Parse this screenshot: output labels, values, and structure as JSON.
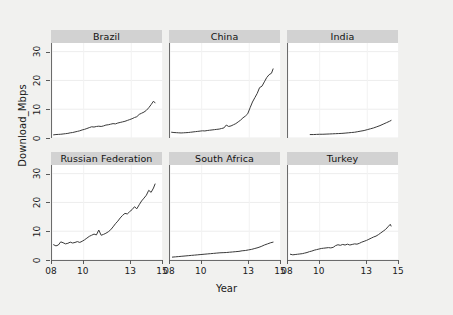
{
  "chart_data": {
    "type": "line",
    "title": "",
    "xlabel": "Year",
    "ylabel": "Download_Mbps",
    "xlim": [
      2008,
      2015
    ],
    "ylim": [
      0,
      33
    ],
    "xticks": [
      2008,
      2010,
      2013,
      2015
    ],
    "xtick_labels": [
      "08",
      "10",
      "13",
      "15"
    ],
    "yticks": [
      0,
      10,
      20,
      30
    ],
    "ytick_labels": [
      "0",
      "10",
      "20",
      "30"
    ],
    "grid": true,
    "legend": "none",
    "layout": {
      "rows": 2,
      "cols": 3
    },
    "line_color": "#3a3a3a",
    "panels": [
      {
        "label": "Brazil",
        "row": 0,
        "col": 0,
        "x": [
          2008.1,
          2008.25,
          2008.4,
          2008.55,
          2008.7,
          2008.85,
          2009.0,
          2009.15,
          2009.3,
          2009.45,
          2009.6,
          2009.75,
          2009.9,
          2010.05,
          2010.2,
          2010.35,
          2010.5,
          2010.65,
          2010.8,
          2010.95,
          2011.1,
          2011.25,
          2011.4,
          2011.55,
          2011.7,
          2011.85,
          2012.0,
          2012.15,
          2012.3,
          2012.45,
          2012.6,
          2012.75,
          2012.9,
          2013.05,
          2013.2,
          2013.35,
          2013.5,
          2013.65,
          2013.8,
          2013.95,
          2014.1,
          2014.25,
          2014.4,
          2014.5
        ],
        "y": [
          1.1,
          1.2,
          1.25,
          1.3,
          1.4,
          1.5,
          1.6,
          1.8,
          1.9,
          2.1,
          2.3,
          2.5,
          2.8,
          3.0,
          3.3,
          3.6,
          3.9,
          3.8,
          4.0,
          4.1,
          4.0,
          4.2,
          4.5,
          4.6,
          4.8,
          5.0,
          4.9,
          5.2,
          5.4,
          5.6,
          5.8,
          6.1,
          6.4,
          6.7,
          7.1,
          7.4,
          8.2,
          8.6,
          9.0,
          9.6,
          10.5,
          11.6,
          12.8,
          12.2
        ]
      },
      {
        "label": "China",
        "row": 0,
        "col": 1,
        "x": [
          2008.1,
          2008.25,
          2008.4,
          2008.55,
          2008.7,
          2008.85,
          2009.0,
          2009.15,
          2009.3,
          2009.45,
          2009.6,
          2009.75,
          2009.9,
          2010.05,
          2010.2,
          2010.35,
          2010.5,
          2010.65,
          2010.8,
          2010.95,
          2011.1,
          2011.25,
          2011.4,
          2011.55,
          2011.7,
          2011.85,
          2012.0,
          2012.15,
          2012.3,
          2012.45,
          2012.6,
          2012.75,
          2012.9,
          2013.05,
          2013.2,
          2013.35,
          2013.5,
          2013.65,
          2013.8,
          2013.95,
          2014.1,
          2014.25,
          2014.4,
          2014.5
        ],
        "y": [
          2.0,
          1.9,
          1.85,
          1.8,
          1.75,
          1.8,
          1.85,
          1.9,
          2.0,
          2.1,
          2.2,
          2.3,
          2.4,
          2.5,
          2.45,
          2.6,
          2.7,
          2.8,
          2.9,
          3.0,
          3.1,
          3.3,
          3.5,
          4.5,
          4.0,
          4.2,
          4.6,
          5.0,
          5.6,
          6.2,
          7.0,
          7.6,
          8.4,
          10.5,
          12.5,
          14.0,
          15.5,
          17.5,
          18.0,
          19.5,
          21.0,
          22.0,
          22.5,
          24.0
        ]
      },
      {
        "label": "India",
        "row": 0,
        "col": 2,
        "x": [
          2009.4,
          2009.6,
          2009.8,
          2010.0,
          2010.2,
          2010.4,
          2010.6,
          2010.8,
          2011.0,
          2011.2,
          2011.4,
          2011.6,
          2011.8,
          2012.0,
          2012.2,
          2012.4,
          2012.6,
          2012.8,
          2013.0,
          2013.2,
          2013.4,
          2013.6,
          2013.8,
          2014.0,
          2014.2,
          2014.4,
          2014.5
        ],
        "y": [
          1.2,
          1.2,
          1.25,
          1.3,
          1.3,
          1.35,
          1.4,
          1.45,
          1.5,
          1.55,
          1.6,
          1.7,
          1.8,
          1.9,
          2.0,
          2.2,
          2.4,
          2.6,
          2.9,
          3.2,
          3.5,
          3.9,
          4.3,
          4.8,
          5.3,
          5.8,
          6.1
        ]
      },
      {
        "label": "Russian Federation",
        "row": 1,
        "col": 0,
        "x": [
          2008.1,
          2008.25,
          2008.4,
          2008.55,
          2008.7,
          2008.85,
          2009.0,
          2009.15,
          2009.3,
          2009.45,
          2009.6,
          2009.75,
          2009.9,
          2010.05,
          2010.2,
          2010.35,
          2010.5,
          2010.65,
          2010.8,
          2010.95,
          2011.1,
          2011.25,
          2011.4,
          2011.55,
          2011.7,
          2011.85,
          2012.0,
          2012.15,
          2012.3,
          2012.45,
          2012.6,
          2012.75,
          2012.9,
          2013.05,
          2013.2,
          2013.35,
          2013.5,
          2013.65,
          2013.8,
          2013.95,
          2014.1,
          2014.25,
          2014.4,
          2014.5
        ],
        "y": [
          5.3,
          4.9,
          5.2,
          6.3,
          6.0,
          5.6,
          5.8,
          6.2,
          5.9,
          6.1,
          6.4,
          6.1,
          6.5,
          7.0,
          7.6,
          8.2,
          8.6,
          9.0,
          8.7,
          10.4,
          8.6,
          8.9,
          9.3,
          9.8,
          10.5,
          11.5,
          12.6,
          13.5,
          14.6,
          15.5,
          16.2,
          16.0,
          16.8,
          17.5,
          18.5,
          17.8,
          19.2,
          20.5,
          21.5,
          22.5,
          24.2,
          23.5,
          25.0,
          26.4
        ]
      },
      {
        "label": "South Africa",
        "row": 1,
        "col": 1,
        "x": [
          2008.15,
          2008.35,
          2008.55,
          2008.75,
          2008.95,
          2009.15,
          2009.35,
          2009.55,
          2009.75,
          2009.95,
          2010.15,
          2010.35,
          2010.55,
          2010.75,
          2010.95,
          2011.15,
          2011.35,
          2011.55,
          2011.75,
          2011.95,
          2012.15,
          2012.35,
          2012.55,
          2012.75,
          2012.95,
          2013.15,
          2013.35,
          2013.55,
          2013.75,
          2013.95,
          2014.15,
          2014.35,
          2014.5
        ],
        "y": [
          1.0,
          1.1,
          1.2,
          1.3,
          1.4,
          1.5,
          1.6,
          1.7,
          1.8,
          1.9,
          2.0,
          2.1,
          2.2,
          2.3,
          2.4,
          2.5,
          2.55,
          2.6,
          2.7,
          2.8,
          2.9,
          3.0,
          3.2,
          3.3,
          3.5,
          3.7,
          4.0,
          4.3,
          4.7,
          5.2,
          5.6,
          6.0,
          6.2
        ]
      },
      {
        "label": "Turkey",
        "row": 1,
        "col": 2,
        "x": [
          2008.15,
          2008.3,
          2008.45,
          2008.6,
          2008.75,
          2008.9,
          2009.05,
          2009.2,
          2009.35,
          2009.5,
          2009.65,
          2009.8,
          2009.95,
          2010.1,
          2010.25,
          2010.4,
          2010.55,
          2010.7,
          2010.85,
          2011.0,
          2011.15,
          2011.3,
          2011.45,
          2011.6,
          2011.75,
          2011.9,
          2012.05,
          2012.2,
          2012.35,
          2012.5,
          2012.65,
          2012.8,
          2012.95,
          2013.1,
          2013.25,
          2013.4,
          2013.55,
          2013.7,
          2013.85,
          2014.0,
          2014.15,
          2014.3,
          2014.45,
          2014.5
        ],
        "y": [
          2.0,
          1.8,
          1.9,
          2.0,
          2.1,
          2.2,
          2.4,
          2.6,
          2.9,
          3.1,
          3.4,
          3.6,
          3.8,
          4.0,
          4.1,
          4.2,
          4.3,
          4.2,
          4.4,
          5.0,
          5.3,
          5.1,
          5.4,
          5.2,
          5.5,
          5.2,
          5.4,
          5.6,
          5.5,
          5.8,
          6.2,
          6.5,
          6.8,
          7.2,
          7.6,
          8.0,
          8.3,
          8.8,
          9.4,
          10.0,
          10.6,
          11.5,
          12.4,
          11.8
        ]
      }
    ]
  }
}
